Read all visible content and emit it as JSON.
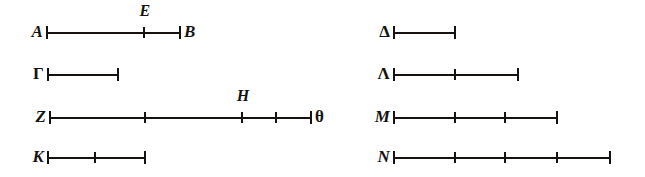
{
  "figure": {
    "ink_color": "#15120f",
    "background_color": "#ffffff",
    "width": 645,
    "height": 177,
    "segments": [
      {
        "id": "segment-A-B",
        "start_label": "A",
        "end_label": "B",
        "y": 33,
        "x_start": 47,
        "x_end": 180,
        "ticks": [
          {
            "x": 144,
            "label": "E"
          }
        ]
      },
      {
        "id": "segment-Gamma",
        "start_label": "Γ",
        "end_label": "",
        "y": 75,
        "x_start": 48,
        "x_end": 118,
        "ticks": []
      },
      {
        "id": "segment-Z-theta",
        "start_label": "Z",
        "end_label": "θ",
        "y": 118,
        "x_start": 50,
        "x_end": 311,
        "ticks": [
          {
            "x": 145,
            "label": ""
          },
          {
            "x": 242,
            "label": "H"
          },
          {
            "x": 276,
            "label": ""
          }
        ]
      },
      {
        "id": "segment-K",
        "start_label": "K",
        "end_label": "",
        "y": 158,
        "x_start": 48,
        "x_end": 145,
        "ticks": [
          {
            "x": 95,
            "label": ""
          }
        ]
      },
      {
        "id": "segment-Delta",
        "start_label": "Δ",
        "end_label": "",
        "y": 33,
        "x_start": 394,
        "x_end": 455,
        "ticks": []
      },
      {
        "id": "segment-Lambda",
        "start_label": "Λ",
        "end_label": "",
        "y": 75,
        "x_start": 394,
        "x_end": 518,
        "ticks": [
          {
            "x": 455,
            "label": ""
          }
        ]
      },
      {
        "id": "segment-M",
        "start_label": "M",
        "end_label": "",
        "y": 118,
        "x_start": 394,
        "x_end": 557,
        "ticks": [
          {
            "x": 455,
            "label": ""
          },
          {
            "x": 505,
            "label": ""
          }
        ]
      },
      {
        "id": "segment-N",
        "start_label": "N",
        "end_label": "",
        "y": 158,
        "x_start": 394,
        "x_end": 610,
        "ticks": [
          {
            "x": 455,
            "label": ""
          },
          {
            "x": 505,
            "label": ""
          },
          {
            "x": 557,
            "label": ""
          }
        ]
      }
    ]
  }
}
